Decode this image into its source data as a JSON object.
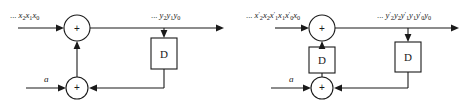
{
  "figure": {
    "background_color": "#ffffff",
    "line_color": "#1a1a1a",
    "width": 469,
    "height": 108,
    "panel_count": 2
  },
  "diagrams": [
    {
      "id": "left",
      "name": "serial-adder-single-delay",
      "input_label": "... x₂x₁x₀",
      "output_label": "... y₂y₁y₀",
      "coefficient_label": "a",
      "delay_label": "D",
      "adder_symbol": "+",
      "adders": [
        {
          "name": "top-adder",
          "symbol": "+",
          "cx": 77,
          "cy": 28,
          "r": 13
        },
        {
          "name": "bottom-adder",
          "symbol": "+",
          "cx": 77,
          "cy": 88,
          "r": 11
        }
      ],
      "delays": [
        {
          "name": "delay-d",
          "label": "D",
          "x": 151,
          "y": 38,
          "w": 26,
          "h": 31
        }
      ]
    },
    {
      "id": "right",
      "name": "serial-adder-double-delay",
      "input_label": "... x′₂x₂x′₁x₁x′₀x₀",
      "output_label": "... y′₂y₂y′₁y₁y′₀y₀",
      "coefficient_label": "a",
      "delay_label": "D",
      "adder_symbol": "+",
      "adders": [
        {
          "name": "top-adder",
          "symbol": "+",
          "cx": 87,
          "cy": 28,
          "r": 13
        },
        {
          "name": "bottom-adder",
          "symbol": "+",
          "cx": 87,
          "cy": 88,
          "r": 11
        }
      ],
      "delays": [
        {
          "name": "delay-d-feedback",
          "label": "D",
          "x": 74,
          "y": 47,
          "w": 26,
          "h": 26
        },
        {
          "name": "delay-d-output",
          "label": "D",
          "x": 160,
          "y": 42,
          "w": 26,
          "h": 30
        }
      ]
    }
  ],
  "labels": {
    "ellipsis": "...",
    "delay_d": "D",
    "plus": "+",
    "coefficient_a": "a"
  }
}
